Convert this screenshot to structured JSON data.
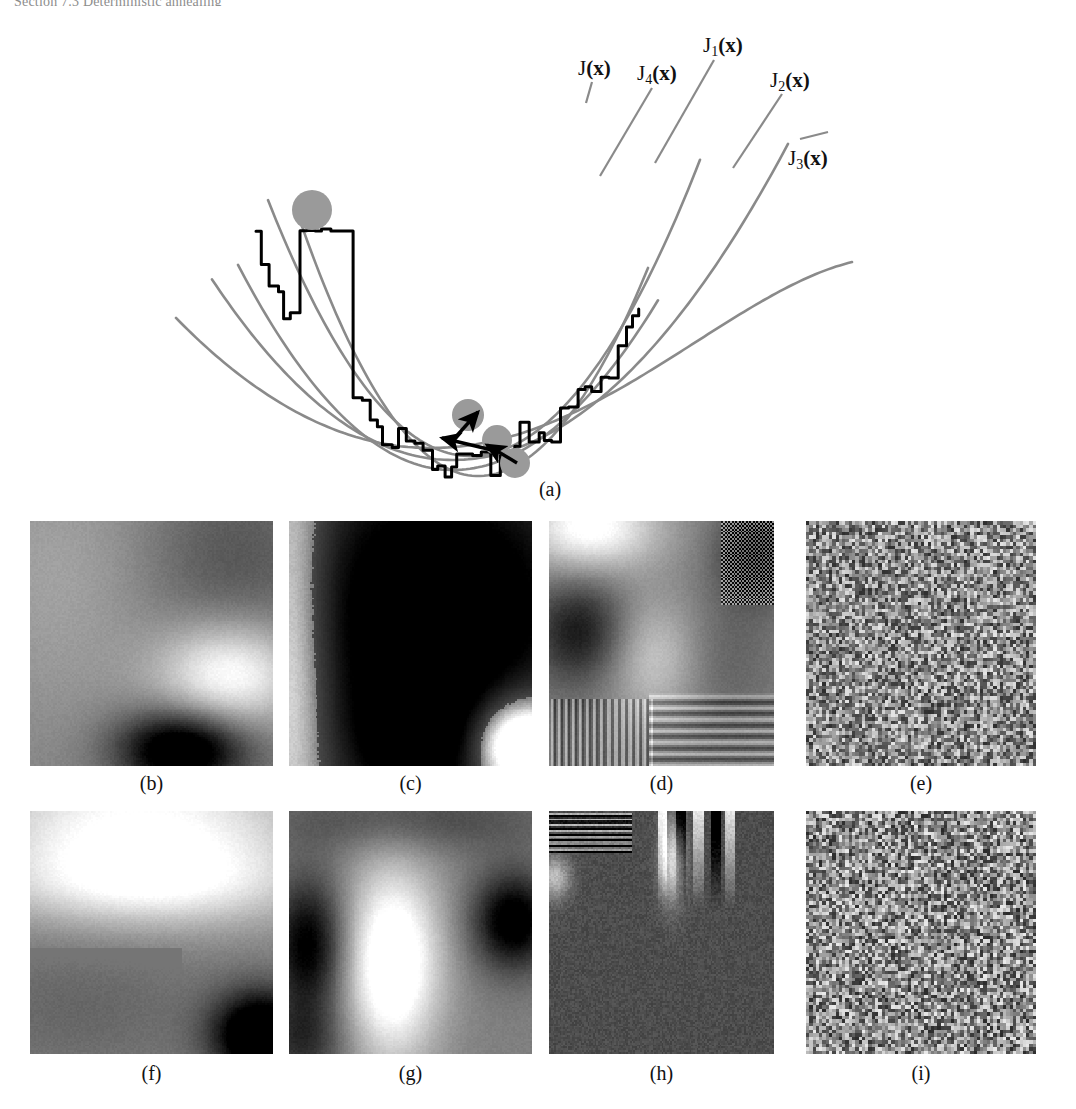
{
  "page": {
    "running_head": "Section 7.3   Deterministic annealing",
    "width": 1076,
    "height": 1109,
    "background": "#ffffff"
  },
  "colors": {
    "ink": "#111111",
    "energy_curve": "#000000",
    "smoothed_curve": "#8a8a8a",
    "ball_fill": "#9a9a9a",
    "arrow": "#000000",
    "caption": "#111111"
  },
  "panel_a": {
    "caption": "(a)",
    "description": "Energy landscape J(x) with a family of progressively smoothed surrogate functions and a ball descending through local minima",
    "curve_labels": [
      {
        "id": "J",
        "base": "J",
        "sub": "",
        "arg": "(x)",
        "x": 578,
        "y": 50
      },
      {
        "id": "J4",
        "base": "J",
        "sub": "4",
        "arg": "(x)",
        "x": 637,
        "y": 55
      },
      {
        "id": "J1",
        "base": "J",
        "sub": "1",
        "arg": "(x)",
        "x": 703,
        "y": 27
      },
      {
        "id": "J2",
        "base": "J",
        "sub": "2",
        "arg": "(x)",
        "x": 770,
        "y": 62
      },
      {
        "id": "J3",
        "base": "J",
        "sub": "3",
        "arg": "(x)",
        "x": 788,
        "y": 140
      }
    ],
    "leader_lines": [
      {
        "for": "J",
        "x1": 592,
        "y1": 74,
        "x2": 586,
        "y2": 95
      },
      {
        "for": "J4",
        "x1": 652,
        "y1": 80,
        "x2": 600,
        "y2": 168
      },
      {
        "for": "J1",
        "x1": 714,
        "y1": 52,
        "x2": 655,
        "y2": 155
      },
      {
        "for": "J2",
        "x1": 782,
        "y1": 86,
        "x2": 733,
        "y2": 160
      },
      {
        "for": "J3",
        "x1": 800,
        "y1": 131,
        "x2": 828,
        "y2": 124
      }
    ],
    "balls": [
      {
        "id": "ball-start",
        "cx": 312,
        "cy": 202,
        "r": 20
      },
      {
        "id": "ball-mid-1",
        "cx": 468,
        "cy": 407,
        "r": 16
      },
      {
        "id": "ball-mid-2",
        "cx": 497,
        "cy": 432,
        "r": 15
      },
      {
        "id": "ball-final",
        "cx": 515,
        "cy": 455,
        "r": 15
      }
    ],
    "arrows": [
      {
        "id": "arrow-1",
        "x1": 453,
        "y1": 432,
        "x2": 478,
        "y2": 404
      },
      {
        "id": "arrow-2",
        "x1": 492,
        "y1": 442,
        "x2": 442,
        "y2": 430
      },
      {
        "id": "arrow-3",
        "x1": 517,
        "y1": 455,
        "x2": 487,
        "y2": 437
      }
    ]
  },
  "image_grid": {
    "rows": [
      {
        "panels": [
          {
            "id": "b",
            "caption": "(b)",
            "kind": "blurred",
            "seed": 11,
            "description": "Smoothly blurred grayscale field: mid gray upper-left, darker upper-right, bright band lower-right, black wedge bottom"
          },
          {
            "id": "c",
            "caption": "(c)",
            "kind": "blurred",
            "seed": 23,
            "description": "High-contrast blurred field: light vertical strip at left, large black region, white bottom-right corner"
          },
          {
            "id": "d",
            "caption": "(d)",
            "kind": "textured",
            "seed": 37,
            "description": "Blurred field with superimposed vertical stripes bottom-left, horizontal stripes bottom-right and checkerboard top-right"
          },
          {
            "id": "e",
            "caption": "(e)",
            "kind": "noise",
            "seed": 41,
            "description": "Fine-grained random grayscale noise"
          }
        ]
      },
      {
        "panels": [
          {
            "id": "f",
            "caption": "(f)",
            "kind": "blurred",
            "seed": 53,
            "description": "Bright upper half, flat mid-gray lower-left, black blob bottom-right corner"
          },
          {
            "id": "g",
            "caption": "(g)",
            "kind": "blurred",
            "seed": 67,
            "description": "Bright vertical band through centre with dark blobs at left and right edges"
          },
          {
            "id": "h",
            "caption": "(h)",
            "kind": "streaks",
            "seed": 79,
            "description": "Mostly dark field with bright vertical streaks and horizontal bars across the top"
          },
          {
            "id": "i",
            "caption": "(i)",
            "kind": "noise",
            "seed": 97,
            "description": "Fine-grained random grayscale noise"
          }
        ]
      }
    ],
    "geometry": {
      "columns_x": [
        30,
        289,
        549,
        806
      ],
      "columns_w": [
        243,
        243,
        225,
        230
      ],
      "row_y": [
        521,
        811
      ],
      "row_h": [
        245,
        243
      ],
      "caption_y": [
        772,
        1062
      ]
    }
  }
}
